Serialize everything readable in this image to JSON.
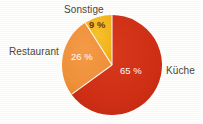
{
  "chart_data": {
    "type": "pie",
    "title": "",
    "categories": [
      "Küche",
      "Restaurant",
      "Sonstige"
    ],
    "values": [
      65,
      26,
      9
    ],
    "value_labels": [
      "65 %",
      "26 %",
      "9 %"
    ],
    "unit": "%",
    "colors": [
      "#ce2e14",
      "#f0913c",
      "#f2b51e"
    ],
    "legend": "none",
    "labels_position": "outside-with-value-inside",
    "start_angle_deg": 0,
    "direction": "clockwise",
    "grid": false
  },
  "figure": {
    "background_color": "#fdfdfc",
    "label_color": "#4a4440",
    "slice_label_light_color": "#ffffff",
    "slice_label_dark_color": "#6b3410"
  },
  "labels": {
    "kueche": "Küche",
    "restaurant": "Restaurant",
    "sonstige": "Sonstige"
  },
  "values": {
    "kueche": "65 %",
    "restaurant": "26 %",
    "sonstige": "9 %"
  }
}
